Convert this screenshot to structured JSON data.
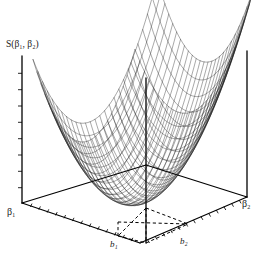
{
  "figure": {
    "background_color": "#ffffff",
    "line_color": "#000000",
    "mesh_color": "#1a1a1a"
  },
  "labels": {
    "vertical_axis": "S(β₁, β₂)",
    "beta1_axis": "β₁",
    "beta2_axis": "β₂",
    "b1_tick": "b₁",
    "b2_tick": "b₂"
  },
  "caption": {
    "text": ""
  },
  "chart_data": {
    "type": "surface",
    "title": "S(β₁, β₂)",
    "xlabel": "β₁",
    "ylabel": "β₂",
    "zlabel": "S(β₁, β₂)",
    "surface_function": "S = a*(x - bx)^2 + b*(y - by)^2",
    "grid": true,
    "legend": "none",
    "xlim": [
      -1,
      1
    ],
    "ylim": [
      -1,
      1
    ],
    "zlim": [
      0,
      1
    ],
    "minimum_point": {
      "beta1": "b₁",
      "beta2": "b₂",
      "value": "S_min"
    },
    "mesh_rows": 26,
    "mesh_cols": 26,
    "tick_count_beta1": 14,
    "tick_count_beta2": 14,
    "tick_count_vertical": 9,
    "annotations": [
      {
        "name": "dashed-projection-to-b1",
        "style": "dashed",
        "from": "surface-minimum",
        "to": "b₁"
      },
      {
        "name": "dashed-projection-to-b2",
        "style": "dashed",
        "from": "surface-minimum",
        "to": "b₂"
      },
      {
        "name": "vertical-drop-line",
        "style": "solid",
        "from": "back-top-corner",
        "to": "base-front-corner"
      }
    ]
  }
}
